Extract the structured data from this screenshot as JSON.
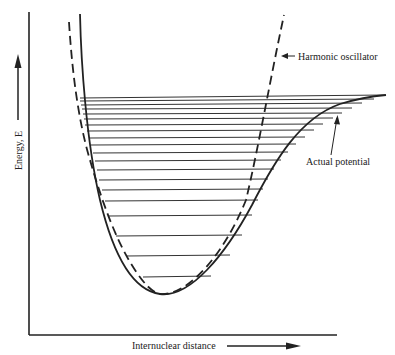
{
  "diagram": {
    "type": "potential-energy-curve",
    "y_axis_label": "Energy, E",
    "x_axis_label": "Internuclear distance",
    "annotations": {
      "harmonic": "Harmonic oscillator",
      "actual": "Actual potential"
    },
    "colors": {
      "ink": "#222222",
      "background": "#ffffff"
    },
    "energy_levels_count": 19,
    "curves": [
      {
        "name": "Actual potential",
        "style": "solid"
      },
      {
        "name": "Harmonic oscillator",
        "style": "dashed"
      }
    ]
  }
}
